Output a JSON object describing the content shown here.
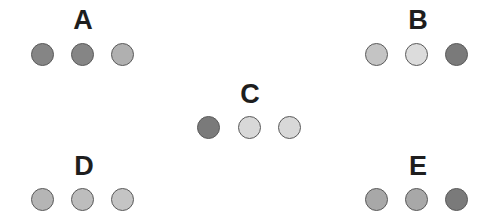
{
  "diagram": {
    "groups": [
      {
        "id": "A",
        "label": "A",
        "label_center_x": 83,
        "label_top": 7,
        "circle_y": 55,
        "circles": [
          {
            "x": 43,
            "color": "#858585"
          },
          {
            "x": 83,
            "color": "#858585"
          },
          {
            "x": 123,
            "color": "#b0b0b0"
          }
        ]
      },
      {
        "id": "B",
        "label": "B",
        "label_center_x": 418,
        "label_top": 7,
        "circle_y": 55,
        "circles": [
          {
            "x": 377,
            "color": "#c4c4c4"
          },
          {
            "x": 417,
            "color": "#dcdcdc"
          },
          {
            "x": 457,
            "color": "#7a7a7a"
          }
        ]
      },
      {
        "id": "C",
        "label": "C",
        "label_center_x": 250,
        "label_top": 81,
        "circle_y": 128,
        "circles": [
          {
            "x": 209,
            "color": "#7a7a7a"
          },
          {
            "x": 250,
            "color": "#d8d8d8"
          },
          {
            "x": 290,
            "color": "#d8d8d8"
          }
        ]
      },
      {
        "id": "D",
        "label": "D",
        "label_center_x": 84,
        "label_top": 153,
        "circle_y": 200,
        "circles": [
          {
            "x": 43,
            "color": "#b5b5b5"
          },
          {
            "x": 83,
            "color": "#bdbdbd"
          },
          {
            "x": 123,
            "color": "#c4c4c4"
          }
        ]
      },
      {
        "id": "E",
        "label": "E",
        "label_center_x": 418,
        "label_top": 153,
        "circle_y": 200,
        "circles": [
          {
            "x": 377,
            "color": "#a8a8a8"
          },
          {
            "x": 417,
            "color": "#a8a8a8"
          },
          {
            "x": 457,
            "color": "#7a7a7a"
          }
        ]
      }
    ]
  }
}
